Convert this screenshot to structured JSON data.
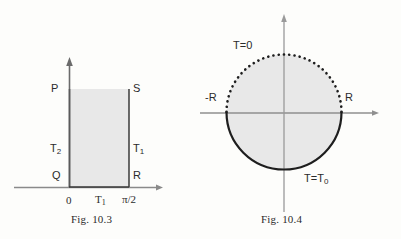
{
  "page": {
    "background_color": "#fdfdfb",
    "ink_color": "#2b2b2b",
    "fill_color": "#e8e8e8"
  },
  "figures": [
    {
      "id": "fig-10-3",
      "caption": "Fig. 10.3",
      "type": "rectangular-domain-diagram",
      "description": "Shaded rectangle PQRS on coordinate axes with boundary temperature labels",
      "vertex_labels": {
        "top_left": "P",
        "bottom_left": "Q",
        "bottom_right": "R",
        "top_right": "S"
      },
      "edge_labels": {
        "left": "T",
        "left_sub": "2",
        "right": "T",
        "right_sub": "1"
      },
      "axis_ticks": [
        {
          "label": "0",
          "sub": ""
        },
        {
          "label": "T",
          "sub": "1"
        },
        {
          "label": "π/2",
          "sub": ""
        }
      ],
      "axes": {
        "x_arrow": true,
        "y_arrow": true
      }
    },
    {
      "id": "fig-10-4",
      "caption": "Fig. 10.4",
      "type": "circular-domain-diagram",
      "description": "Shaded disc of radius R on coordinate axes; dotted upper semicircle boundary, solid lower semicircle boundary",
      "boundary_labels": {
        "upper": "T=0",
        "lower": "T=T",
        "lower_sub": "0"
      },
      "axis_ticks": [
        {
          "label": "-R"
        },
        {
          "label": "R"
        }
      ],
      "axes": {
        "x_arrow": true,
        "y_arrow": true
      },
      "upper_boundary_style": "dotted",
      "lower_boundary_style": "solid"
    }
  ]
}
